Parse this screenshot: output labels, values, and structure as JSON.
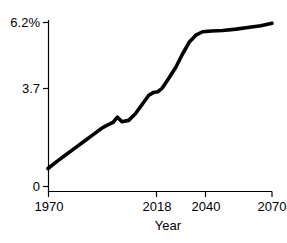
{
  "chart_data": {
    "type": "line",
    "title": "",
    "xlabel": "Year",
    "ylabel": "",
    "xlim": [
      1970,
      2070
    ],
    "ylim": [
      0,
      6.2
    ],
    "grid": false,
    "legend": null,
    "x_ticks": [
      1970,
      2018,
      2040,
      2070
    ],
    "x_tick_labels": [
      "1970",
      "2018",
      "2040",
      "2070"
    ],
    "y_ticks": [
      0,
      3.7,
      6.2
    ],
    "y_tick_labels": [
      "0",
      "3.7",
      "6.2%"
    ],
    "series": [
      {
        "name": "share",
        "color": "#000000",
        "x": [
          1970,
          1974,
          1978,
          1982,
          1986,
          1990,
          1994,
          1996,
          1999,
          2001,
          2003,
          2006,
          2009,
          2012,
          2015,
          2017,
          2019,
          2021,
          2024,
          2027,
          2030,
          2033,
          2036,
          2039,
          2043,
          2048,
          2054,
          2060,
          2065,
          2070
        ],
        "y": [
          0.68,
          0.95,
          1.2,
          1.45,
          1.7,
          1.95,
          2.2,
          2.3,
          2.42,
          2.62,
          2.45,
          2.5,
          2.75,
          3.1,
          3.45,
          3.55,
          3.58,
          3.72,
          4.1,
          4.5,
          5.0,
          5.45,
          5.72,
          5.85,
          5.88,
          5.9,
          5.95,
          6.02,
          6.08,
          6.17
        ]
      }
    ]
  },
  "axis": {
    "x_title": "Year"
  }
}
